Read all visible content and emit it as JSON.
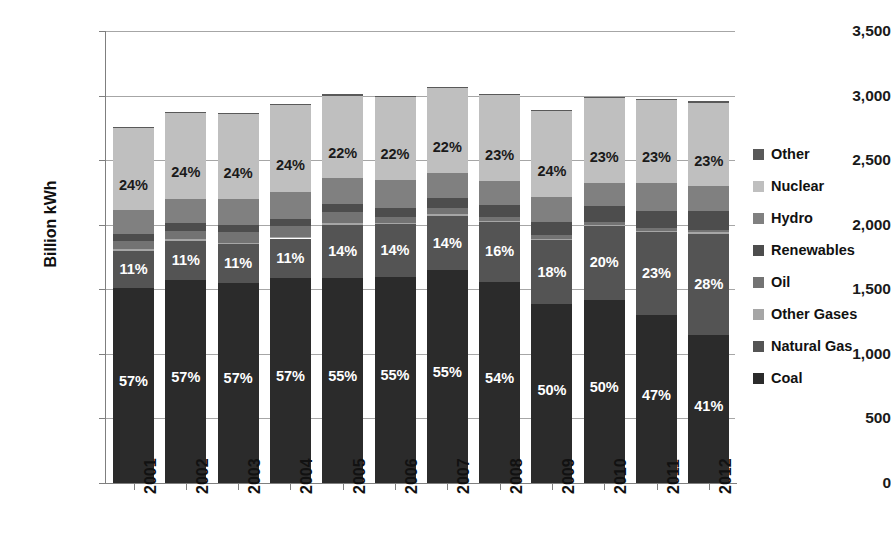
{
  "title_fragment": "",
  "axes": {
    "ylabel": "Billion kWh",
    "yticks": [
      "0",
      "500",
      "1,000",
      "1,500",
      "2,000",
      "2,500",
      "3,000",
      "3,500"
    ],
    "ytick_values": [
      0,
      500,
      1000,
      1500,
      2000,
      2500,
      3000,
      3500
    ],
    "ylim": [
      0,
      3500
    ],
    "xticks": [
      "2001",
      "2002",
      "2003",
      "2004",
      "2005",
      "2006",
      "2007",
      "2008",
      "2009",
      "2010",
      "2011",
      "2012"
    ]
  },
  "legend": {
    "position": "right",
    "items": [
      {
        "label": "Other",
        "color": "#595959"
      },
      {
        "label": "Nuclear",
        "color": "#bfbfbf"
      },
      {
        "label": "Hydro",
        "color": "#808080"
      },
      {
        "label": "Renewables",
        "color": "#4d4d4d"
      },
      {
        "label": "Oil",
        "color": "#737373"
      },
      {
        "label": "Other Gases",
        "color": "#a6a6a6"
      },
      {
        "label": "Natural Gas",
        "color": "#545454"
      },
      {
        "label": "Coal",
        "color": "#2b2b2b"
      }
    ]
  },
  "chart_data": {
    "type": "bar",
    "stacked": true,
    "title": "",
    "xlabel": "",
    "ylabel": "Billion kWh",
    "ylim": [
      0,
      3500
    ],
    "grid": true,
    "legend_position": "right",
    "units": "Billion kWh",
    "categories": [
      "2001",
      "2002",
      "2003",
      "2004",
      "2005",
      "2006",
      "2007",
      "2008",
      "2009",
      "2010",
      "2011",
      "2012"
    ],
    "totals": [
      2760,
      2875,
      2865,
      2935,
      3010,
      3000,
      3070,
      3015,
      2890,
      2990,
      2975,
      2955
    ],
    "stack_order_bottom_to_top": [
      "Coal",
      "Natural Gas",
      "Other Gases",
      "Oil",
      "Renewables",
      "Hydro",
      "Nuclear",
      "Other"
    ],
    "series": [
      {
        "name": "Coal",
        "color": "#2b2b2b",
        "percent": [
          57,
          57,
          57,
          57,
          55,
          55,
          55,
          54,
          50,
          50,
          47,
          41
        ],
        "values": [
          1573,
          1639,
          1633,
          1673,
          1656,
          1650,
          1689,
          1628,
          1445,
          1495,
          1398,
          1211
        ],
        "labels": [
          "57%",
          "57%",
          "57%",
          "57%",
          "55%",
          "55%",
          "55%",
          "54%",
          "50%",
          "50%",
          "47%",
          "41%"
        ]
      },
      {
        "name": "Natural Gas",
        "color": "#545454",
        "percent": [
          11,
          11,
          11,
          11,
          14,
          14,
          14,
          16,
          18,
          20,
          23,
          28
        ],
        "values": [
          304,
          316,
          315,
          323,
          421,
          420,
          430,
          482,
          520,
          598,
          684,
          827
        ],
        "labels": [
          "11%",
          "11%",
          "11%",
          "11%",
          "14%",
          "14%",
          "14%",
          "16%",
          "18%",
          "20%",
          "23%",
          "28%"
        ]
      },
      {
        "name": "Other Gases",
        "color": "#a6a6a6",
        "percent": [
          0.5,
          0.5,
          0.5,
          0.5,
          0.5,
          0.5,
          0.5,
          0.4,
          0.4,
          0.4,
          0.4,
          0.4
        ],
        "values": [
          14,
          14,
          14,
          15,
          15,
          15,
          15,
          12,
          12,
          12,
          12,
          12
        ],
        "labels": [
          "",
          "",
          "",
          "",
          "",
          "",
          "",
          "",
          "",
          "",
          "",
          ""
        ]
      },
      {
        "name": "Oil",
        "color": "#737373",
        "percent": [
          2.5,
          2.4,
          3.0,
          3.0,
          3.0,
          1.6,
          1.6,
          1.1,
          1.0,
          0.9,
          0.7,
          0.6
        ],
        "values": [
          69,
          69,
          86,
          88,
          90,
          48,
          49,
          33,
          29,
          27,
          21,
          18
        ],
        "labels": [
          "",
          "",
          "",
          "",
          "",
          "",
          "",
          "",
          "",
          "",
          "",
          ""
        ]
      },
      {
        "name": "Renewables",
        "color": "#4d4d4d",
        "percent": [
          2.0,
          2.0,
          2.0,
          2.0,
          2.2,
          2.4,
          2.5,
          3.1,
          3.6,
          4.1,
          4.7,
          5.4
        ],
        "values": [
          55,
          58,
          57,
          59,
          66,
          72,
          77,
          93,
          104,
          123,
          140,
          160
        ],
        "labels": [
          "",
          "",
          "",
          "",
          "",
          "",
          "",
          "",
          "",
          "",
          "",
          ""
        ]
      },
      {
        "name": "Hydro",
        "color": "#808080",
        "percent": [
          7.0,
          7.0,
          7.5,
          7.5,
          7.0,
          7.5,
          6.5,
          6.5,
          7.0,
          6.5,
          8.0,
          6.8
        ],
        "values": [
          193,
          201,
          215,
          220,
          211,
          225,
          200,
          196,
          202,
          194,
          238,
          201
        ],
        "labels": [
          "",
          "",
          "",
          "",
          "",
          "",
          "",
          "",
          "",
          "",
          "",
          ""
        ]
      },
      {
        "name": "Nuclear",
        "color": "#bfbfbf",
        "percent": [
          24,
          24,
          24,
          24,
          22,
          22,
          22,
          23,
          24,
          23,
          23,
          23
        ],
        "values": [
          662,
          690,
          688,
          704,
          662,
          660,
          675,
          693,
          694,
          687,
          684,
          680
        ],
        "labels": [
          "24%",
          "24%",
          "24%",
          "24%",
          "22%",
          "22%",
          "22%",
          "23%",
          "24%",
          "23%",
          "23%",
          "23%"
        ]
      },
      {
        "name": "Other",
        "color": "#595959",
        "percent": [
          0.4,
          0.4,
          0.4,
          0.4,
          0.4,
          0.4,
          0.4,
          0.4,
          0.4,
          0.4,
          0.4,
          0.4
        ],
        "values": [
          11,
          11,
          11,
          12,
          12,
          12,
          12,
          12,
          12,
          12,
          12,
          12
        ],
        "labels": [
          "",
          "",
          "",
          "",
          "",
          "",
          "",
          "",
          "",
          "",
          "",
          ""
        ]
      }
    ]
  }
}
